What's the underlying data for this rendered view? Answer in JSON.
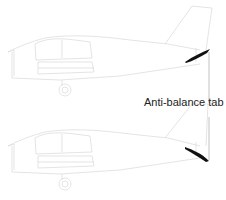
{
  "diagram": {
    "title": "",
    "views": [
      {
        "name": "upper-aircraft",
        "tab_deflection": "up"
      },
      {
        "name": "lower-aircraft",
        "tab_deflection": "down"
      }
    ],
    "callout": {
      "label": "Anti-balance tab"
    },
    "colors": {
      "outline": "#d8d8d8",
      "tab": "#111111",
      "leader": "#9a9a9a",
      "text": "#222222"
    }
  }
}
